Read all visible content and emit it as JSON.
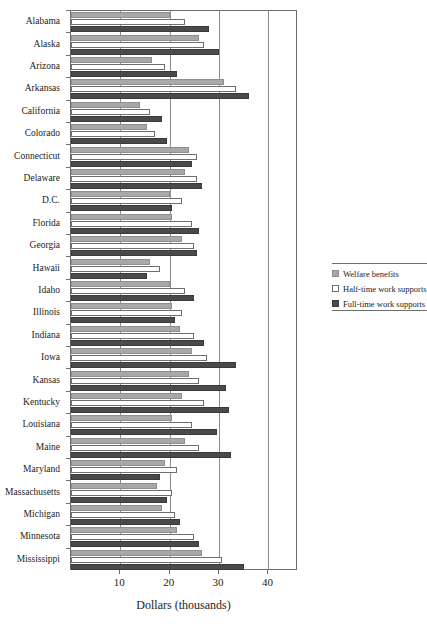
{
  "chart_data": {
    "type": "bar",
    "orientation": "horizontal",
    "title": "",
    "xlabel": "Dollars (thousands)",
    "ylabel": "",
    "xlim": [
      0,
      46
    ],
    "xticks": [
      10,
      20,
      30,
      40
    ],
    "xtick_labels": [
      "10",
      "20",
      "30",
      "40"
    ],
    "grid": true,
    "legend_position": "right",
    "categories": [
      "Alabama",
      "Alaska",
      "Arizona",
      "Arkansas",
      "California",
      "Colorado",
      "Connecticut",
      "Delaware",
      "D.C.",
      "Florida",
      "Georgia",
      "Hawaii",
      "Idaho",
      "Illinois",
      "Indiana",
      "Iowa",
      "Kansas",
      "Kentucky",
      "Louisiana",
      "Maine",
      "Maryland",
      "Massachusetts",
      "Michigan",
      "Minnesota",
      "Mississippi"
    ],
    "series": [
      {
        "name": "Welfare benefits",
        "color": "#a8a8a8",
        "values": [
          20.0,
          26.0,
          16.5,
          31.0,
          14.0,
          15.5,
          24.0,
          23.0,
          20.0,
          20.5,
          22.5,
          16.0,
          20.0,
          20.5,
          22.0,
          24.5,
          24.0,
          22.5,
          20.5,
          23.0,
          19.0,
          17.5,
          18.5,
          21.5,
          26.5
        ]
      },
      {
        "name": "Half-time work supports",
        "color": "#ffffff",
        "values": [
          23.0,
          27.0,
          19.0,
          33.5,
          16.0,
          17.0,
          25.5,
          25.5,
          22.5,
          24.5,
          25.0,
          18.0,
          23.0,
          22.5,
          25.0,
          27.5,
          26.0,
          27.0,
          24.5,
          26.0,
          21.5,
          20.5,
          21.0,
          25.0,
          30.5
        ]
      },
      {
        "name": "Full-time work supports",
        "color": "#4a4a4a",
        "values": [
          28.0,
          30.0,
          21.5,
          36.0,
          18.5,
          19.5,
          24.5,
          26.5,
          20.5,
          26.0,
          25.5,
          15.5,
          25.0,
          21.0,
          27.0,
          33.5,
          31.5,
          32.0,
          29.5,
          32.5,
          18.0,
          19.5,
          22.0,
          26.0,
          35.0
        ]
      }
    ]
  },
  "legend": {
    "items": [
      {
        "label": "Welfare benefits",
        "swatch": "welfare"
      },
      {
        "label": "Half-time work supports",
        "swatch": "half"
      },
      {
        "label": "Full-time work supports",
        "swatch": "full"
      }
    ]
  }
}
